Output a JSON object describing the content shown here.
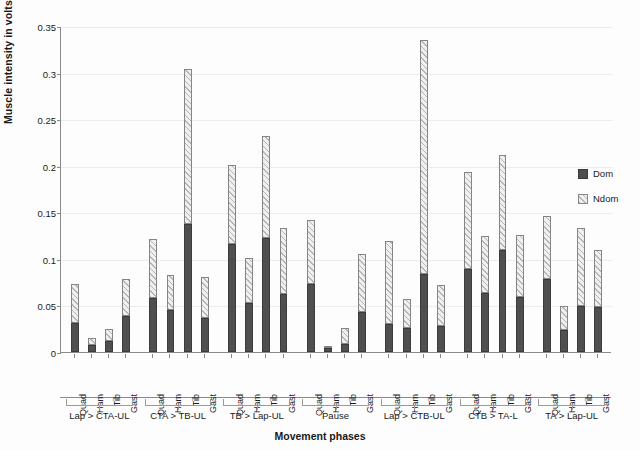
{
  "chart_data": {
    "type": "bar",
    "title": "",
    "subtitle": "",
    "xlabel": "Movement phases",
    "ylabel": "Muscle intensity in volts",
    "ylim": [
      0,
      0.35
    ],
    "ytick_labels": [
      "0.35",
      "0.3",
      "0.25",
      "0.2",
      "0.15",
      "0.1",
      "0.05",
      "0"
    ],
    "ytick_values": [
      0.35,
      0.3,
      0.25,
      0.2,
      0.15,
      0.1,
      0.05,
      0
    ],
    "grid": "horizontal",
    "stacked": true,
    "legend_position": "right",
    "legend": [
      "Dom",
      "Ndom"
    ],
    "colors": {
      "dom": "#4f4f4f",
      "ndom": "#efefef",
      "ndom_hatch": "#b6b6b6",
      "axis": "#8a8a8a",
      "gridline": "#ececec",
      "text": "#1a1a1a"
    },
    "muscles": [
      "Quad",
      "Ham",
      "Tib",
      "Gast"
    ],
    "groups": [
      "Lap > CTA-UL",
      "CTA > TB-UL",
      "TB > Lap-UL",
      "Pause",
      "Lap > CTB-UL",
      "CTB > TA-L",
      "TA > Lap-UL"
    ],
    "series": [
      {
        "name": "Dom",
        "values": [
          0.031,
          0.008,
          0.012,
          0.039,
          0.058,
          0.045,
          0.137,
          0.037,
          0.116,
          0.053,
          0.122,
          0.062,
          0.073,
          0.004,
          0.009,
          0.043,
          0.03,
          0.026,
          0.084,
          0.028,
          0.089,
          0.063,
          0.11,
          0.059,
          0.078,
          0.024,
          0.049,
          0.048
        ]
      },
      {
        "name": "Ndom",
        "values": [
          0.042,
          0.007,
          0.013,
          0.039,
          0.063,
          0.038,
          0.167,
          0.044,
          0.085,
          0.048,
          0.11,
          0.071,
          0.069,
          0.003,
          0.017,
          0.062,
          0.089,
          0.031,
          0.251,
          0.044,
          0.104,
          0.062,
          0.102,
          0.067,
          0.068,
          0.025,
          0.084,
          0.061
        ]
      }
    ],
    "totals": [
      0.073,
      0.015,
      0.025,
      0.078,
      0.121,
      0.083,
      0.304,
      0.081,
      0.201,
      0.101,
      0.232,
      0.133,
      0.142,
      0.007,
      0.026,
      0.105,
      0.119,
      0.057,
      0.335,
      0.072,
      0.193,
      0.125,
      0.212,
      0.126,
      0.146,
      0.049,
      0.133,
      0.109
    ]
  }
}
